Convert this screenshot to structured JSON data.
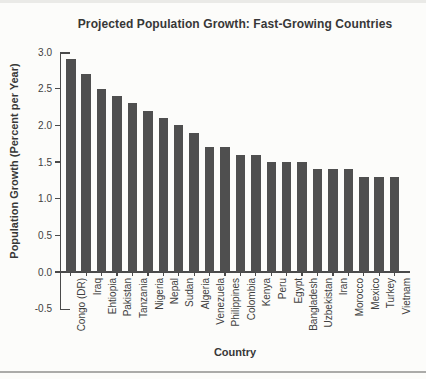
{
  "page": {
    "background": "#fcfcfa",
    "top_strip_color": "#eaeae7",
    "divider_color": "#ababa9"
  },
  "chart_data": {
    "type": "bar",
    "title": "Projected Population Growth: Fast-Growing Countries",
    "xlabel": "Country",
    "ylabel": "Population Growth (Percent per Year)",
    "categories": [
      "Congo (DR)",
      "Iraq",
      "Ehtiopia",
      "Pakistan",
      "Tanzania",
      "Nigeria",
      "Nepal",
      "Sudan",
      "Algeria",
      "Venezuela",
      "Philippines",
      "Colombia",
      "Kenya",
      "Peru",
      "Egypt",
      "Bangladesh",
      "Uzbekistan",
      "Iran",
      "Morocco",
      "Mexico",
      "Turkey",
      "Vietnam"
    ],
    "values": [
      2.9,
      2.7,
      2.5,
      2.4,
      2.3,
      2.2,
      2.1,
      2.0,
      1.9,
      1.7,
      1.7,
      1.6,
      1.6,
      1.5,
      1.5,
      1.5,
      1.4,
      1.4,
      1.4,
      1.3,
      1.3,
      1.3
    ],
    "ylim": [
      -0.5,
      3.0
    ],
    "yticks": [
      "3.0",
      "2.5",
      "2.0",
      "1.5",
      "1.0",
      "0.5",
      "0.0",
      "-0.5"
    ],
    "grid": false,
    "legend": null,
    "bar_color": "#4f4f4f",
    "axis_color": "#4a4a4a"
  }
}
